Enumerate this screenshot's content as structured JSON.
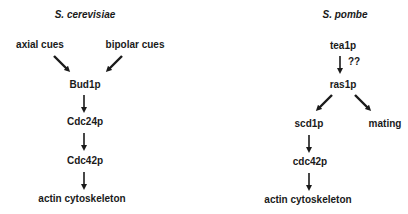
{
  "left_panel": {
    "title": "S. cerevisiae",
    "inputs": [
      "axial cues",
      "bipolar cues"
    ],
    "nodes": [
      "Bud1p",
      "Cdc24p",
      "Cdc42p",
      "actin cytoskeleton"
    ]
  },
  "right_panel": {
    "title": "S. pombe",
    "nodes": {
      "tea1p": "tea1p",
      "ras1p": "ras1p",
      "scd1p": "scd1p",
      "mating": "mating",
      "cdc42p": "cdc42p",
      "actin": "actin cytoskeleton"
    },
    "uncertain_label": "??"
  },
  "colors": {
    "text": "#1a1a1a",
    "arrow": "#1a1a1a",
    "background": "#ffffff"
  }
}
